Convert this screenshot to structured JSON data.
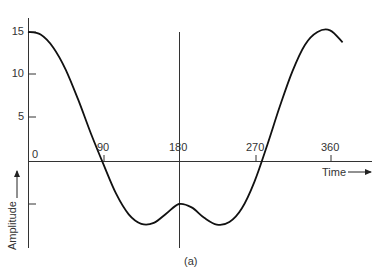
{
  "chart_data": {
    "type": "line",
    "title": "",
    "caption": "(a)",
    "xlabel": "Time",
    "ylabel": "Amplitude",
    "xlim": [
      0,
      375
    ],
    "ylim": [
      -10,
      17
    ],
    "x_ticks": [
      90,
      180,
      270,
      360
    ],
    "x_tick_labels": [
      "90",
      "180",
      "270",
      "360"
    ],
    "x_origin_label": "0",
    "y_ticks": [
      15,
      10,
      5,
      -5
    ],
    "y_tick_labels": [
      "15",
      "10",
      "5",
      ""
    ],
    "grid": false,
    "vertical_reference_line_x": 180,
    "series": [
      {
        "name": "waveform",
        "x": [
          0,
          15,
          30,
          45,
          60,
          75,
          90,
          105,
          120,
          135,
          150,
          165,
          180,
          195,
          210,
          225,
          240,
          255,
          270,
          285,
          300,
          315,
          330,
          345,
          360,
          375
        ],
        "y": [
          15.0,
          14.7,
          13.2,
          10.6,
          7.1,
          3.2,
          -0.4,
          -3.8,
          -6.2,
          -7.3,
          -7.2,
          -6.1,
          -5.0,
          -5.4,
          -6.6,
          -7.4,
          -7.1,
          -5.5,
          -2.4,
          1.8,
          6.3,
          10.4,
          13.5,
          15.0,
          15.2,
          13.8
        ]
      }
    ]
  },
  "labels": {
    "caption": "(a)",
    "xlabel": "Time",
    "ylabel": "Amplitude",
    "origin": "0",
    "x90": "90",
    "x180": "180",
    "x270": "270",
    "x360": "360",
    "y15": "15",
    "y10": "10",
    "y5": "5"
  }
}
